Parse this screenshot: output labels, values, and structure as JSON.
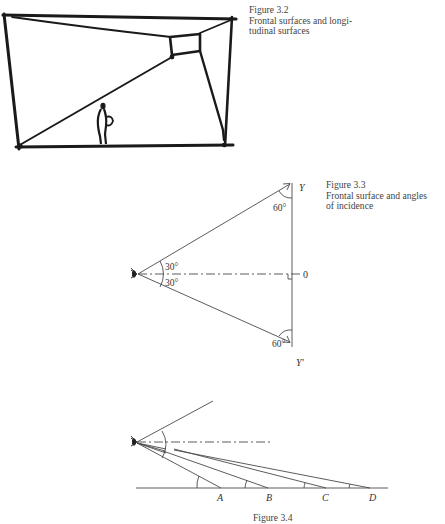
{
  "figures": [
    {
      "id": "fig-3-2",
      "caption": {
        "number": "Figure 3.2",
        "lines": [
          "Frontal surfaces and longi-",
          "tudinal surfaces"
        ]
      }
    },
    {
      "id": "fig-3-3",
      "caption": {
        "number": "Figure 3.3",
        "lines": [
          "Frontal surface and angles",
          "of incidence"
        ]
      },
      "labels": {
        "top_point": "Y",
        "bottom_point": "Y'",
        "center_point": "0",
        "angle_top": "60°",
        "angle_bottom": "60°",
        "angle_upper_half": "30°",
        "angle_lower_half": "30°"
      },
      "icons": [
        "eye-icon"
      ]
    },
    {
      "id": "fig-3-4",
      "caption": {
        "number": "Figure 3.4"
      },
      "labels": {
        "points": [
          "A",
          "B",
          "C",
          "D"
        ]
      },
      "icons": [
        "eye-icon"
      ]
    }
  ]
}
